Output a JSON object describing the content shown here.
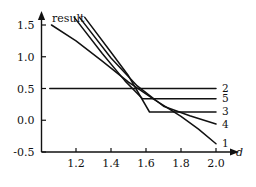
{
  "chart_data": {
    "type": "line",
    "title": "",
    "xlabel": "d",
    "ylabel": "result",
    "xlim": [
      1.05,
      2.05
    ],
    "ylim": [
      -0.62,
      1.62
    ],
    "grid": false,
    "legend_position": "right-end-labels",
    "xticks": [
      "1.2",
      "1.4",
      "1.6",
      "1.8",
      "2.0"
    ],
    "xtick_values": [
      1.2,
      1.4,
      1.6,
      1.8,
      2.0
    ],
    "yticks": [
      "1.5",
      "1.0",
      "0.5",
      "0.0",
      "-0.5"
    ],
    "ytick_values": [
      1.5,
      1.0,
      0.5,
      0.0,
      -0.5
    ],
    "series": [
      {
        "name": "1",
        "label": "1",
        "color": "#111111",
        "x": [
          1.06,
          1.2,
          1.35,
          1.5,
          1.65,
          1.8,
          1.9,
          2.0
        ],
        "values": [
          1.5,
          1.25,
          0.93,
          0.6,
          0.32,
          0.06,
          -0.14,
          -0.37
        ]
      },
      {
        "name": "2",
        "label": "2",
        "color": "#111111",
        "x": [
          1.05,
          1.5,
          2.0
        ],
        "values": [
          0.5,
          0.5,
          0.5
        ]
      },
      {
        "name": "3",
        "label": "3",
        "color": "#111111",
        "x": [
          1.25,
          1.4,
          1.5,
          1.62,
          1.8,
          2.0
        ],
        "values": [
          1.62,
          1.07,
          0.7,
          0.13,
          0.13,
          0.13
        ]
      },
      {
        "name": "4",
        "label": "4",
        "color": "#111111",
        "x": [
          1.22,
          1.4,
          1.55,
          1.7,
          1.85,
          2.0
        ],
        "values": [
          1.62,
          0.98,
          0.54,
          0.22,
          0.07,
          -0.06
        ]
      },
      {
        "name": "5",
        "label": "5",
        "color": "#111111",
        "x": [
          1.19,
          1.35,
          1.48,
          1.58,
          1.8,
          2.0
        ],
        "values": [
          1.62,
          1.05,
          0.62,
          0.34,
          0.34,
          0.34
        ]
      }
    ],
    "annotations": [
      {
        "text": "result",
        "role": "y-axis-name"
      },
      {
        "text": "d",
        "role": "x-axis-name"
      }
    ]
  },
  "axis": {
    "y_name": "result",
    "x_name": "d"
  }
}
